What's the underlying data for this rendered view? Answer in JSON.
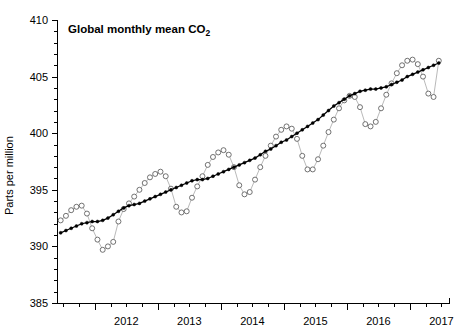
{
  "chart_data": {
    "type": "line",
    "title": "Global monthly mean CO2",
    "title_display": "Global monthly mean CO",
    "title_subscript": "2",
    "xlabel": "",
    "ylabel": "Parts per million",
    "xlim": [
      2011.4,
      2017.62
    ],
    "ylim": [
      385,
      410
    ],
    "y_ticks_major": [
      385,
      390,
      395,
      400,
      405,
      410
    ],
    "y_ticks_minor_step": 1,
    "x_ticks_major": [
      2012,
      2013,
      2014,
      2015,
      2016,
      2017
    ],
    "x_ticks_minor_step": 0.25,
    "x_tick_labels": [
      "2012",
      "2013",
      "2014",
      "2015",
      "2016",
      "2017"
    ],
    "y_tick_labels": [
      "385",
      "390",
      "395",
      "400",
      "405",
      "410"
    ],
    "grid": false,
    "legend": "none",
    "series": [
      {
        "name": "Monthly mean",
        "marker": "open-circle",
        "color": "#5a5a5a",
        "x": [
          2011.458,
          2011.542,
          2011.625,
          2011.708,
          2011.792,
          2011.875,
          2011.958,
          2012.042,
          2012.125,
          2012.208,
          2012.292,
          2012.375,
          2012.458,
          2012.542,
          2012.625,
          2012.708,
          2012.792,
          2012.875,
          2012.958,
          2013.042,
          2013.125,
          2013.208,
          2013.292,
          2013.375,
          2013.458,
          2013.542,
          2013.625,
          2013.708,
          2013.792,
          2013.875,
          2013.958,
          2014.042,
          2014.125,
          2014.208,
          2014.292,
          2014.375,
          2014.458,
          2014.542,
          2014.625,
          2014.708,
          2014.792,
          2014.875,
          2014.958,
          2015.042,
          2015.125,
          2015.208,
          2015.292,
          2015.375,
          2015.458,
          2015.542,
          2015.625,
          2015.708,
          2015.792,
          2015.875,
          2015.958,
          2016.042,
          2016.125,
          2016.208,
          2016.292,
          2016.375,
          2016.458,
          2016.542,
          2016.625,
          2016.708,
          2016.792,
          2016.875,
          2016.958,
          2017.042,
          2017.125,
          2017.208,
          2017.292,
          2017.375,
          2017.458
        ],
        "y": [
          392.3,
          392.7,
          393.2,
          393.5,
          393.6,
          392.9,
          391.6,
          390.6,
          389.7,
          390.0,
          390.4,
          392.2,
          393.3,
          393.8,
          394.4,
          395.0,
          395.6,
          396.1,
          396.4,
          396.6,
          396.2,
          395.1,
          393.5,
          393.0,
          393.1,
          394.3,
          395.3,
          396.2,
          397.2,
          397.9,
          398.3,
          398.5,
          398.1,
          397.0,
          395.4,
          394.6,
          394.8,
          395.9,
          397.0,
          398.0,
          398.9,
          399.7,
          400.3,
          400.6,
          400.4,
          399.5,
          398.0,
          396.8,
          396.8,
          397.7,
          398.9,
          400.1,
          401.2,
          402.2,
          402.9,
          403.3,
          403.2,
          402.3,
          400.8,
          400.6,
          401.0,
          402.2,
          403.4,
          404.4,
          405.3,
          406.0,
          406.4,
          406.5,
          406.1,
          405.0,
          403.5,
          403.2,
          406.4
        ]
      },
      {
        "name": "Trend (seasonally adjusted)",
        "marker": "filled-dot",
        "color": "#000000",
        "x": [
          2011.458,
          2011.542,
          2011.625,
          2011.708,
          2011.792,
          2011.875,
          2011.958,
          2012.042,
          2012.125,
          2012.208,
          2012.292,
          2012.375,
          2012.458,
          2012.542,
          2012.625,
          2012.708,
          2012.792,
          2012.875,
          2012.958,
          2013.042,
          2013.125,
          2013.208,
          2013.292,
          2013.375,
          2013.458,
          2013.542,
          2013.625,
          2013.708,
          2013.792,
          2013.875,
          2013.958,
          2014.042,
          2014.125,
          2014.208,
          2014.292,
          2014.375,
          2014.458,
          2014.542,
          2014.625,
          2014.708,
          2014.792,
          2014.875,
          2014.958,
          2015.042,
          2015.125,
          2015.208,
          2015.292,
          2015.375,
          2015.458,
          2015.542,
          2015.625,
          2015.708,
          2015.792,
          2015.875,
          2015.958,
          2016.042,
          2016.125,
          2016.208,
          2016.292,
          2016.375,
          2016.458,
          2016.542,
          2016.625,
          2016.708,
          2016.792,
          2016.875,
          2016.958,
          2017.042,
          2017.125,
          2017.208,
          2017.292,
          2017.375,
          2017.458
        ],
        "y": [
          391.2,
          391.4,
          391.6,
          391.8,
          392.0,
          392.1,
          392.2,
          392.2,
          392.3,
          392.5,
          392.8,
          393.1,
          393.4,
          393.6,
          393.7,
          393.8,
          394.0,
          394.2,
          394.4,
          394.6,
          394.8,
          395.0,
          395.2,
          395.4,
          395.6,
          395.8,
          395.9,
          395.9,
          396.0,
          396.2,
          396.4,
          396.6,
          396.8,
          397.0,
          397.2,
          397.4,
          397.6,
          397.8,
          398.1,
          398.4,
          398.6,
          398.9,
          399.2,
          399.4,
          399.7,
          400.0,
          400.3,
          400.6,
          400.9,
          401.2,
          401.6,
          402.0,
          402.4,
          402.7,
          403.0,
          403.3,
          403.5,
          403.7,
          403.8,
          403.9,
          403.9,
          404.0,
          404.1,
          404.3,
          404.5,
          404.7,
          405.0,
          405.2,
          405.4,
          405.6,
          405.8,
          406.0,
          406.2
        ]
      }
    ]
  },
  "figure": {
    "background": "#ffffff",
    "axis_color": "#000000",
    "plot_left": 57,
    "plot_right": 449,
    "plot_top": 20,
    "plot_bottom": 303
  }
}
